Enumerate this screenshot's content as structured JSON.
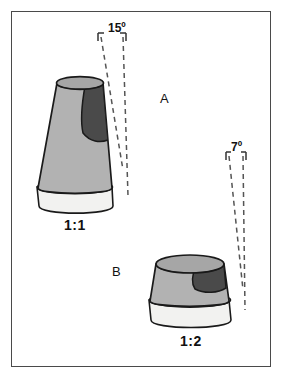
{
  "figure": {
    "background_color": "#ffffff",
    "frame_color": "#4a4a4a"
  },
  "palette": {
    "body_gray": "#b4b4b4",
    "top_gray": "#a8a8a8",
    "dark_patch": "#4a4a4a",
    "base_light": "#f0f0f0",
    "outline": "#1a1a1a",
    "dashed": "#555555",
    "text": "#111111"
  },
  "objects": [
    {
      "id": "cone-a",
      "object_label": "A",
      "ratio_label": "1:1",
      "angle_label": "15º",
      "angle_degrees": 15,
      "description": "tall truncated cone, steep sides"
    },
    {
      "id": "cone-b",
      "object_label": "B",
      "ratio_label": "1:2",
      "angle_label": "7º",
      "angle_degrees": 7,
      "description": "short wide truncated cone, shallow sides"
    }
  ],
  "annotations": {
    "angle_a": "15º",
    "angle_b": "7º",
    "label_a": "A",
    "label_b": "B",
    "ratio_a": "1:1",
    "ratio_b": "1:2"
  }
}
